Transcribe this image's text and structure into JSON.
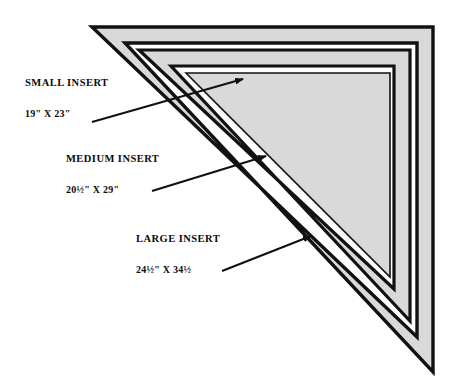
{
  "figure": {
    "name": "nested-triangle-insert-diagram",
    "background_color": "#ffffff",
    "fill_color": "#d9d9d9",
    "outline_color": "#111111",
    "arrow_color": "#111111"
  },
  "labels": [
    {
      "id": "small",
      "title": "SMALL INSERT",
      "dimensions": "19\" X 23\"",
      "arrow": {
        "tail_x": 92,
        "tail_y": 122,
        "tip_x": 243,
        "tip_y": 79
      }
    },
    {
      "id": "medium",
      "title": "MEDIUM INSERT",
      "dimensions": "20½\" X 29\"",
      "arrow": {
        "tail_x": 152,
        "tail_y": 191,
        "tip_x": 266,
        "tip_y": 156
      }
    },
    {
      "id": "large",
      "title": "LARGE INSERT",
      "dimensions": "24½\" X 34½",
      "arrow": {
        "tail_x": 222,
        "tail_y": 271,
        "tip_x": 311,
        "tip_y": 236
      }
    }
  ],
  "shapes": {
    "outer_triangle": {
      "name": "large-insert-outline",
      "points": "92,27 433,27 433,372"
    },
    "outer_triangle_inner_edge": {
      "name": "large-insert-inner-edge",
      "points": "125,43 417,43 417,337"
    },
    "middle_triangle": {
      "name": "medium-insert-outline",
      "points": "139,50 410,50 410,321"
    },
    "middle_triangle_inner_edge": {
      "name": "medium-insert-inner-edge",
      "points": "171,66 394,66 394,289"
    },
    "inner_triangle": {
      "name": "small-insert-outline",
      "points": "186,73 390,73 390,277"
    }
  }
}
